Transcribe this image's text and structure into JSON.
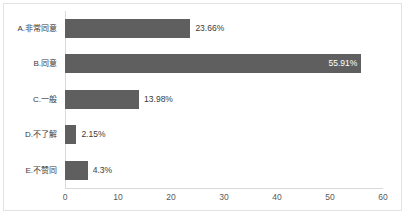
{
  "chart_data": {
    "type": "bar",
    "orientation": "horizontal",
    "title": "",
    "subtitle": "",
    "xlabel": "",
    "ylabel": "",
    "categories": [
      "A.非常同意",
      "B.同意",
      "C.一般",
      "D.不了解",
      "E.不赞同"
    ],
    "values": [
      23.66,
      55.91,
      13.98,
      2.15,
      4.3
    ],
    "data_labels": [
      "23.66%",
      "55.91%",
      "13.98%",
      "2.15%",
      "4.3%"
    ],
    "label_placement": [
      "outside-end",
      "inside-end",
      "outside-end",
      "outside-end",
      "outside-end"
    ],
    "xlim": [
      0,
      60
    ],
    "xticks": [
      0,
      10,
      20,
      30,
      40,
      50,
      60
    ],
    "xtick_labels": [
      "0",
      "10",
      "20",
      "30",
      "40",
      "50",
      "60"
    ],
    "grid": false,
    "legend": false,
    "series": [
      {
        "name": "",
        "values": [
          23.66,
          55.91,
          13.98,
          2.15,
          4.3
        ]
      }
    ]
  },
  "style": {
    "bar_color": "#5f5f5f",
    "inside_label_color": "#ffffff",
    "outside_label_color": "#3a3a3a",
    "axis_line_color": "#d9d9d9",
    "border_color": "#e3e3e3",
    "background": "#ffffff"
  }
}
